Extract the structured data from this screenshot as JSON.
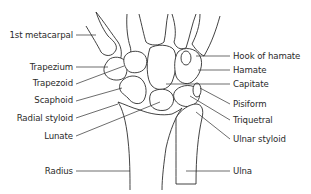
{
  "diagram": {
    "line_color": "#2e2e2e",
    "text_color": "#2a2a2a",
    "background": "#ffffff",
    "labels_left": [
      {
        "id": "first-metacarpal",
        "text": "1st metacarpal"
      },
      {
        "id": "trapezium",
        "text": "Trapezium"
      },
      {
        "id": "trapezoid",
        "text": "Trapezoid"
      },
      {
        "id": "scaphoid",
        "text": "Scaphoid"
      },
      {
        "id": "radial-styloid",
        "text": "Radial styloid"
      },
      {
        "id": "lunate",
        "text": "Lunate"
      },
      {
        "id": "radius",
        "text": "Radius"
      }
    ],
    "labels_right": [
      {
        "id": "hook-of-hamate",
        "text": "Hook of hamate"
      },
      {
        "id": "hamate",
        "text": "Hamate"
      },
      {
        "id": "capitate",
        "text": "Capitate"
      },
      {
        "id": "pisiform",
        "text": "Pisiform"
      },
      {
        "id": "triquetral",
        "text": "Triquetral"
      },
      {
        "id": "ulnar-styloid",
        "text": "Ulnar styloid"
      },
      {
        "id": "ulna",
        "text": "Ulna"
      }
    ]
  }
}
